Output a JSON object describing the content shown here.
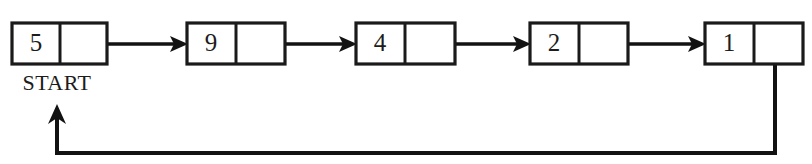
{
  "diagram": {
    "kind": "circular-singly-linked-list",
    "title": "",
    "canvas": {
      "width": 812,
      "height": 164,
      "background": "#ffffff"
    },
    "ink_color": "#121212",
    "nodes": [
      {
        "id": "n1",
        "value": "5",
        "x": 12,
        "y": 23,
        "width": 95,
        "height": 41,
        "divider_x": 60
      },
      {
        "id": "n2",
        "value": "9",
        "x": 187,
        "y": 23,
        "width": 98,
        "height": 41,
        "divider_x": 236
      },
      {
        "id": "n3",
        "value": "4",
        "x": 356,
        "y": 23,
        "width": 99,
        "height": 41,
        "divider_x": 405
      },
      {
        "id": "n4",
        "value": "2",
        "x": 530,
        "y": 23,
        "width": 98,
        "height": 41,
        "divider_x": 579
      },
      {
        "id": "n5",
        "value": "1",
        "x": 705,
        "y": 23,
        "width": 98,
        "height": 41,
        "divider_x": 754
      }
    ],
    "links": [
      {
        "from": "n1",
        "to": "n2",
        "x1": 88,
        "x2": 187,
        "y": 44
      },
      {
        "from": "n2",
        "to": "n3",
        "x1": 264,
        "x2": 356,
        "y": 44
      },
      {
        "from": "n3",
        "to": "n4",
        "x1": 433,
        "x2": 530,
        "y": 44
      },
      {
        "from": "n4",
        "to": "n5",
        "x1": 607,
        "x2": 705,
        "y": 44
      }
    ],
    "wrap_link": {
      "from": "n5",
      "to": "n1",
      "description": "tail pointer loops back to the first node",
      "start_x": 775,
      "start_y": 45,
      "corner_bottom_y": 153,
      "left_x": 57,
      "arrow_tip_y": 108
    },
    "labels": [
      {
        "id": "start",
        "text": "START",
        "x": 57,
        "y": 90
      }
    ]
  }
}
